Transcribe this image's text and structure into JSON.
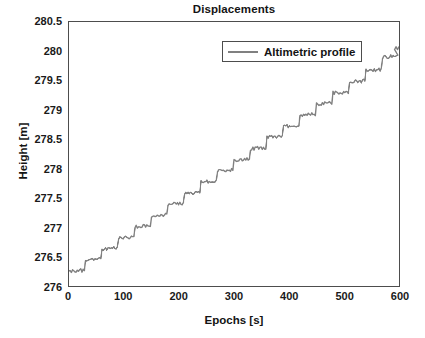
{
  "chart_data": {
    "type": "line",
    "title": "Displacements",
    "xlabel": "Epochs [s]",
    "ylabel": "Height [m]",
    "xlim": [
      0,
      600
    ],
    "ylim": [
      276,
      280.5
    ],
    "xticks": [
      0,
      100,
      200,
      300,
      400,
      500,
      600
    ],
    "yticks": [
      276,
      276.5,
      277,
      277.5,
      278,
      278.5,
      279,
      279.5,
      280,
      280.5
    ],
    "ytick_labels": [
      "276",
      "276.5",
      "277",
      "277.5",
      "278",
      "278.5",
      "279",
      "279.5",
      "280",
      "280.5"
    ],
    "xtick_labels": [
      "0",
      "100",
      "200",
      "300",
      "400",
      "500",
      "600"
    ],
    "grid": false,
    "legend_position": "top-center",
    "series": [
      {
        "name": "Altimetric profile",
        "color": "#808080",
        "linewidth": 1.4,
        "description": "Noisy ascending staircase: roughly 20 plateaus of ~30 s each, each step rising about 0.19 m, from 276.25 m at 0 s to 280.05 m at 600 s, with small ~0.03 m random jitter on each plateau.",
        "step_seconds": 30,
        "step_rise_m": 0.19,
        "noise_amplitude_m": 0.03,
        "x": [
          0,
          30,
          60,
          90,
          120,
          150,
          180,
          210,
          240,
          270,
          300,
          330,
          360,
          390,
          420,
          450,
          480,
          510,
          540,
          570,
          600
        ],
        "values": [
          276.25,
          276.44,
          276.63,
          276.82,
          277.01,
          277.2,
          277.39,
          277.58,
          277.77,
          277.96,
          278.15,
          278.34,
          278.53,
          278.72,
          278.91,
          279.1,
          279.29,
          279.48,
          279.67,
          279.9,
          280.05
        ]
      }
    ]
  },
  "legend": {
    "entries": [
      {
        "label": "Altimetric profile",
        "color": "#808080"
      }
    ]
  },
  "axes": {
    "box_color": "#4d4d4d"
  }
}
